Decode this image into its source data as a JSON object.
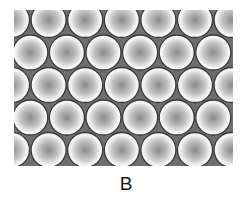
{
  "figure": {
    "label": "B",
    "packing": {
      "type": "hexagonal",
      "region": {
        "x": 14,
        "y": 10,
        "width": 219,
        "height": 156
      },
      "circle_radius": 17.5,
      "horizontal_spacing": 36.6,
      "row_spacing": 32.5,
      "rows": [
        {
          "y": 10,
          "x_centers": [
            -2,
            34.6,
            71.2,
            107.8,
            144.4,
            181,
            217.6
          ]
        },
        {
          "y": 42.5,
          "x_centers": [
            16.3,
            52.9,
            89.5,
            126.1,
            162.7,
            199.3
          ]
        },
        {
          "y": 75,
          "x_centers": [
            -2,
            34.6,
            71.2,
            107.8,
            144.4,
            181,
            217.6
          ]
        },
        {
          "y": 107.5,
          "x_centers": [
            16.3,
            52.9,
            89.5,
            126.1,
            162.7,
            199.3
          ]
        },
        {
          "y": 140,
          "x_centers": [
            -2,
            34.6,
            71.2,
            107.8,
            144.4,
            181,
            217.6
          ]
        }
      ]
    },
    "colors": {
      "background": "#ffffff",
      "interstitial": "#6e6e6e",
      "sphere_rim": "#ffffff",
      "sphere_center": "#8a8a8a",
      "sphere_outline": "#3a3a3a",
      "label": "#1a1a1a"
    }
  }
}
